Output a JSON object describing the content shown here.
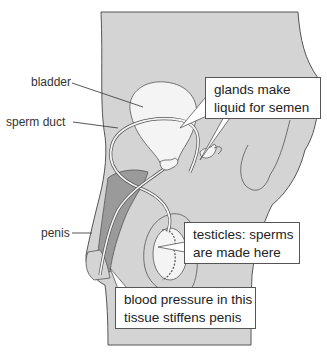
{
  "diagram": {
    "colors": {
      "body_fill": "#d4d4d4",
      "dark_tissue": "#9a9a9a",
      "organ_fill": "#f4f4f4",
      "outline": "#555555",
      "text": "#333333"
    },
    "labels": {
      "bladder": "bladder",
      "sperm_duct": "sperm duct",
      "penis": "penis"
    },
    "callouts": {
      "glands": {
        "line1": "glands make",
        "line2": "liquid for semen"
      },
      "testicles": {
        "line1": "testicles: sperms",
        "line2": "are made here"
      },
      "tissue": {
        "line1": "blood pressure in this",
        "line2": "tissue stiffens penis"
      }
    }
  }
}
